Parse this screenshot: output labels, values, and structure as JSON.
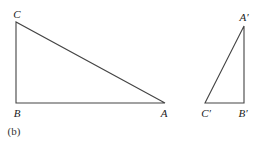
{
  "diagram": {
    "caption": "(b)",
    "stroke_color": "#444444",
    "triangles": [
      {
        "name": "ABC",
        "vertices": {
          "A": {
            "label": "A",
            "x": 165,
            "y": 103
          },
          "B": {
            "label": "B",
            "x": 16,
            "y": 103
          },
          "C": {
            "label": "C",
            "x": 16,
            "y": 22
          }
        },
        "right_angle_at": "B"
      },
      {
        "name": "A'B'C'",
        "vertices": {
          "A": {
            "label": "A′",
            "x": 244,
            "y": 26
          },
          "B": {
            "label": "B′",
            "x": 244,
            "y": 103
          },
          "C": {
            "label": "C′",
            "x": 205,
            "y": 103
          }
        },
        "right_angle_at": "B′"
      }
    ],
    "labels": {
      "C": "C",
      "B": "B",
      "A": "A",
      "A_prime": "A′",
      "B_prime": "B′",
      "C_prime": "C′"
    }
  }
}
